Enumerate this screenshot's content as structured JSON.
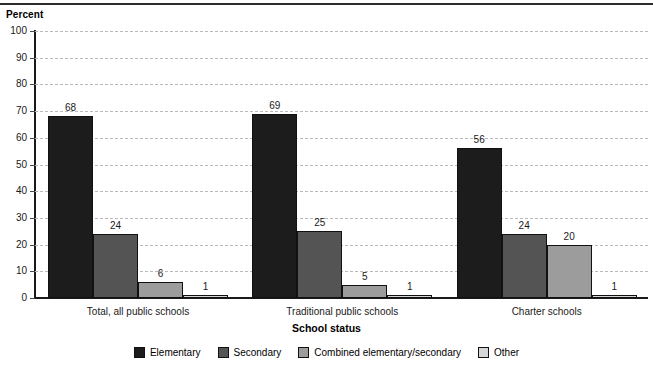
{
  "chart_data": {
    "type": "bar",
    "title": "",
    "xlabel": "School status",
    "ylabel": "Percent",
    "ylim": [
      0,
      100
    ],
    "ytick_step": 10,
    "yticks": [
      0,
      10,
      20,
      30,
      40,
      50,
      60,
      70,
      80,
      90,
      100
    ],
    "grid": true,
    "legend_position": "bottom",
    "categories": [
      "Total, all public schools",
      "Traditional public schools",
      "Charter schools"
    ],
    "series": [
      {
        "name": "Elementary",
        "color": "#1c1c1c",
        "values": [
          68,
          69,
          56
        ]
      },
      {
        "name": "Secondary",
        "color": "#545454",
        "values": [
          24,
          25,
          24
        ]
      },
      {
        "name": "Combined elementary/secondary",
        "color": "#9c9c9c",
        "values": [
          6,
          5,
          20
        ]
      },
      {
        "name": "Other",
        "color": "#d6d6d6",
        "values": [
          1,
          1,
          1
        ]
      }
    ]
  },
  "legend": {
    "items": [
      {
        "label": "Elementary"
      },
      {
        "label": "Secondary"
      },
      {
        "label": "Combined elementary/secondary"
      },
      {
        "label": "Other"
      }
    ]
  }
}
